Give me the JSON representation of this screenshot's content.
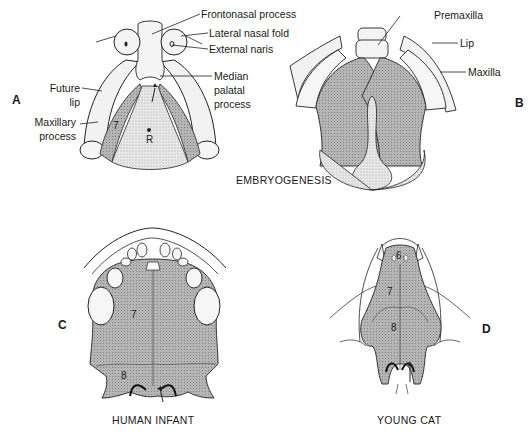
{
  "panels": {
    "A": {
      "letter": "A",
      "labels": {
        "frontonasal": "Frontonasal process",
        "lateral_nasal": "Lateral nasal fold",
        "external_naris": "External naris",
        "median_palatal_1": "Median",
        "median_palatal_2": "palatal",
        "median_palatal_3": "process",
        "future_lip_1": "Future",
        "future_lip_2": "lip",
        "maxillary_1": "Maxillary",
        "maxillary_2": "process"
      },
      "numbers": {
        "seven": "7",
        "r": "R"
      }
    },
    "B": {
      "letter": "B",
      "labels": {
        "premaxilla": "Premaxilla",
        "lip": "Lip",
        "maxilla": "Maxilla"
      }
    },
    "C": {
      "letter": "C",
      "numbers": {
        "seven": "7",
        "eight": "8"
      },
      "caption": "HUMAN INFANT"
    },
    "D": {
      "letter": "D",
      "numbers": {
        "six": "6",
        "seven": "7",
        "eight": "8"
      },
      "caption": "YOUNG CAT"
    }
  },
  "shared_caption": "EMBRYOGENESIS",
  "colors": {
    "palate_shade": "#b3b3b3",
    "light_shade": "#e2e2e2",
    "line": "#222222"
  }
}
